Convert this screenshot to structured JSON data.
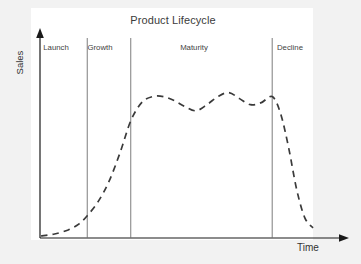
{
  "figure": {
    "title": "Product Lifecycle",
    "background_color": "#f2f2f2",
    "plot_background_color": "#ffffff",
    "axis_color": "#1a1a1a",
    "curve_color": "#3a3a3a",
    "divider_color": "#6e6e6e",
    "label_color": "#3f3f3f"
  },
  "axes": {
    "y_label": "Sales",
    "x_label": "Time"
  },
  "stages": [
    {
      "label": "Launch",
      "center_x": 56
    },
    {
      "label": "Growth",
      "center_x": 100
    },
    {
      "label": "Maturity",
      "center_x": 194
    },
    {
      "label": "Decline",
      "center_x": 290
    }
  ],
  "chart_data": {
    "type": "line",
    "title": "Product Lifecycle",
    "xlabel": "Time",
    "ylabel": "Sales",
    "grid": false,
    "legend": null,
    "linestyle": "dashed",
    "xlim": [
      0,
      100
    ],
    "ylim": [
      0,
      100
    ],
    "axis_ticks": "none",
    "stage_boundaries": [
      17,
      33,
      85
    ],
    "stage_names": [
      "Launch",
      "Growth",
      "Maturity",
      "Decline"
    ],
    "series": [
      {
        "name": "Sales",
        "x": [
          0,
          5,
          10,
          14,
          17,
          21,
          25,
          29,
          33,
          37,
          41,
          45,
          49,
          53,
          57,
          61,
          65,
          69,
          73,
          77,
          81,
          85,
          88,
          91,
          94,
          97,
          100
        ],
        "y": [
          1,
          2,
          4,
          7,
          11,
          18,
          28,
          42,
          58,
          67,
          70,
          70,
          68,
          65,
          63,
          66,
          70,
          72,
          69,
          66,
          67,
          70,
          62,
          45,
          24,
          10,
          5
        ]
      }
    ]
  }
}
